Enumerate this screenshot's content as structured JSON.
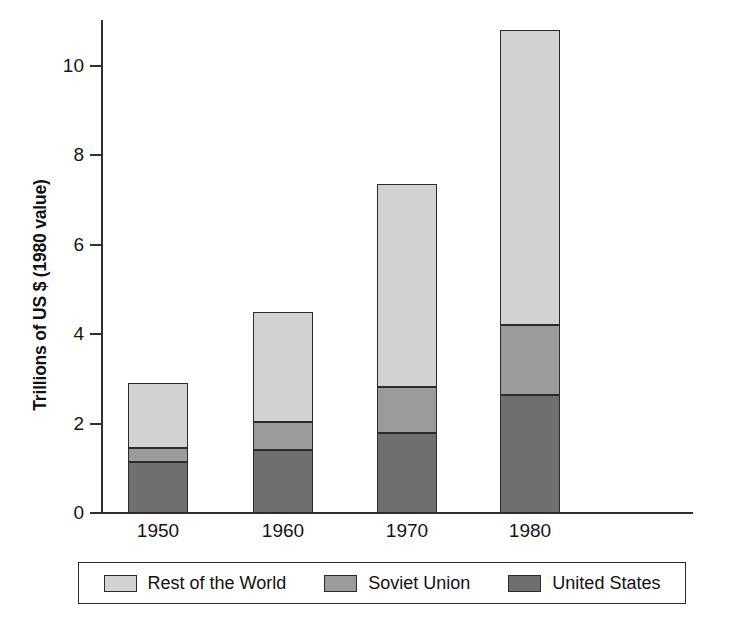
{
  "chart_data": {
    "type": "bar",
    "subtype": "stacked-bar",
    "title": "",
    "xlabel": "",
    "ylabel": "Trillions of US $ (1980 value)",
    "categories": [
      "1950",
      "1960",
      "1970",
      "1980"
    ],
    "ylim": [
      0,
      11.2
    ],
    "yticks": [
      0,
      2,
      4,
      6,
      8,
      10
    ],
    "ytick_labels": [
      "0",
      "2",
      "4",
      "6",
      "8",
      "10"
    ],
    "grid": false,
    "legend_position": "bottom",
    "stack_order_bottom_to_top": [
      "United States",
      "Soviet Union",
      "Rest of the World"
    ],
    "series": [
      {
        "name": "Rest of the World",
        "color": "#d2d2d2",
        "values": [
          1.46,
          2.46,
          4.54,
          6.59
        ]
      },
      {
        "name": "Soviet Union",
        "color": "#9b9b9b",
        "values": [
          0.3,
          0.63,
          1.03,
          1.57
        ]
      },
      {
        "name": "United States",
        "color": "#6f6f6f",
        "values": [
          1.15,
          1.41,
          1.79,
          2.64
        ]
      }
    ],
    "totals": [
      2.91,
      4.5,
      7.36,
      10.8
    ],
    "cumulative_tops": {
      "united_states": [
        1.15,
        1.41,
        1.79,
        2.64
      ],
      "soviet_union": [
        1.45,
        2.04,
        2.82,
        4.21
      ],
      "rest_of_the_world": [
        2.91,
        4.5,
        7.36,
        10.8
      ]
    }
  },
  "axes": {
    "y_title": "Trillions of US $ (1980 value)",
    "y_tick_labels": [
      "10",
      "8",
      "6",
      "4",
      "2",
      "0"
    ],
    "x_tick_labels": [
      "1950",
      "1960",
      "1970",
      "1980"
    ]
  },
  "legend": {
    "entries": [
      {
        "label": "Rest of the World",
        "color": "#d2d2d2"
      },
      {
        "label": "Soviet Union",
        "color": "#9b9b9b"
      },
      {
        "label": "United States",
        "color": "#6f6f6f"
      }
    ]
  },
  "colors": {
    "rest_of_the_world": "#d2d2d2",
    "soviet_union": "#9b9b9b",
    "united_states": "#6f6f6f",
    "axis": "#303030",
    "outline": "#2b2b2b",
    "background": "#ffffff",
    "text": "#111111"
  }
}
